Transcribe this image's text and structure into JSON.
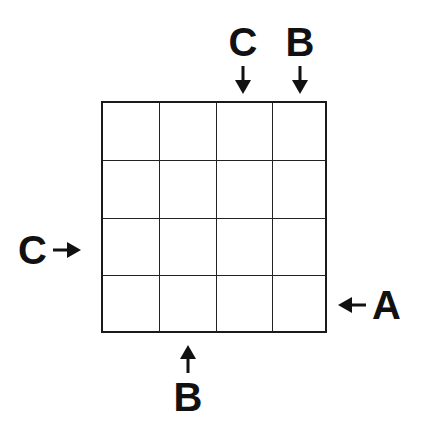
{
  "puzzle": {
    "grid_size": 4,
    "rows": 4,
    "cols": 4,
    "cells": [
      [
        "",
        "",
        "",
        ""
      ],
      [
        "",
        "",
        "",
        ""
      ],
      [
        "",
        "",
        "",
        ""
      ],
      [
        "",
        "",
        "",
        ""
      ]
    ],
    "clues": {
      "top": [
        {
          "col": 3,
          "letter": "C",
          "arrow": "arrow-down-icon"
        },
        {
          "col": 4,
          "letter": "B",
          "arrow": "arrow-down-icon"
        }
      ],
      "left": [
        {
          "row": 3,
          "letter": "C",
          "arrow": "arrow-right-icon"
        }
      ],
      "right": [
        {
          "row": 4,
          "letter": "A",
          "arrow": "arrow-left-icon"
        }
      ],
      "bottom": [
        {
          "col": 2,
          "letter": "B",
          "arrow": "arrow-up-icon"
        }
      ]
    },
    "colors": {
      "ink": "#111111",
      "grid_line": "#222222",
      "background": "#ffffff"
    }
  }
}
